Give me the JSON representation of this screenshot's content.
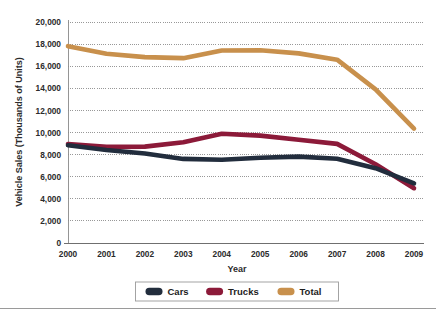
{
  "figure": {
    "background_color": "#ffffff",
    "clipped_header_fragment": "",
    "bottom_rule_color": "#9a9a9a"
  },
  "chart_data": {
    "type": "line",
    "title": "",
    "xlabel": "Year",
    "ylabel": "Vehicle Sales (Thousands of Units)",
    "categories": [
      "2000",
      "2001",
      "2002",
      "2003",
      "2004",
      "2005",
      "2006",
      "2007",
      "2008",
      "2009"
    ],
    "x": [
      2000,
      2001,
      2002,
      2003,
      2004,
      2005,
      2006,
      2007,
      2008,
      2009
    ],
    "series": [
      {
        "name": "Cars",
        "color": "#222d3d",
        "values": [
          8850,
          8420,
          8100,
          7610,
          7540,
          7720,
          7820,
          7620,
          6770,
          5400
        ]
      },
      {
        "name": "Trucks",
        "color": "#8c1a39",
        "values": [
          8960,
          8700,
          8720,
          9120,
          9880,
          9720,
          9340,
          8970,
          7130,
          4960
        ]
      },
      {
        "name": "Total",
        "color": "#c8904c",
        "values": [
          17810,
          17120,
          16820,
          16730,
          17420,
          17440,
          17160,
          16590,
          13900,
          10360
        ]
      }
    ],
    "ylim": [
      0,
      20000
    ],
    "ytick_values": [
      0,
      2000,
      4000,
      6000,
      8000,
      10000,
      12000,
      14000,
      16000,
      18000,
      20000
    ],
    "ytick_labels": [
      "0",
      "2,000",
      "4,000",
      "6,000",
      "8,000",
      "10,000",
      "12,000",
      "14,000",
      "16,000",
      "18,000",
      "20,000"
    ],
    "grid": true,
    "grid_color": "#8d8d8d",
    "grid_style": "dotted",
    "legend_position": "bottom",
    "legend": [
      {
        "label": "Cars",
        "color": "#222d3d"
      },
      {
        "label": "Trucks",
        "color": "#8c1a39"
      },
      {
        "label": "Total",
        "color": "#c8904c"
      }
    ]
  }
}
